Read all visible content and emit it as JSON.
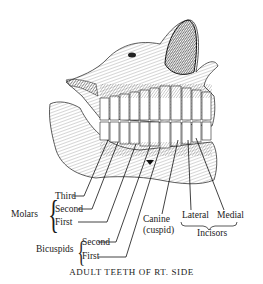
{
  "title": "ADULT TEETH OF RT. SIDE",
  "groups": {
    "molars": {
      "label": "Molars",
      "items": [
        "Third",
        "Second",
        "First"
      ]
    },
    "bicuspids": {
      "label": "Bicuspids",
      "items": [
        "Second",
        "First"
      ]
    },
    "canine": {
      "label": "Canine",
      "sublabel": "(cuspid)"
    },
    "incisors": {
      "label": "Incisors",
      "items": [
        "Lateral",
        "Medial"
      ]
    }
  },
  "colors": {
    "ink": "#1a1a1a",
    "background": "#ffffff"
  }
}
